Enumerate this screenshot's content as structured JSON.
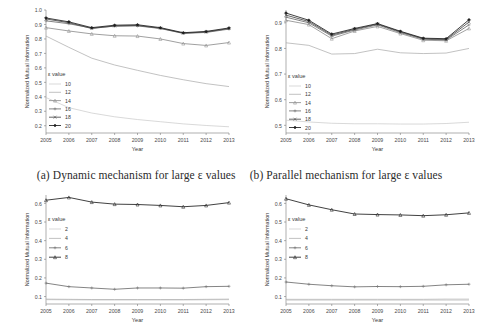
{
  "figure": {
    "captions": [
      {
        "id": "a",
        "text": "(a) Dynamic mechanism for large ε values"
      },
      {
        "id": "b",
        "text": "(b) Parallel mechanism for large ε values"
      }
    ]
  },
  "chart_data": [
    {
      "id": "panel-a",
      "type": "line",
      "title": "",
      "xlabel": "Year",
      "ylabel": "Normalized Mutual Information",
      "x": [
        2005,
        2006,
        2007,
        2008,
        2009,
        2010,
        2011,
        2012,
        2013
      ],
      "categories": [
        "2005",
        "2006",
        "2007",
        "2008",
        "2009",
        "2010",
        "2011",
        "2012",
        "2013"
      ],
      "xlim": [
        2005,
        2013
      ],
      "ylim": [
        0.15,
        1.0
      ],
      "yticks": [
        0.2,
        0.3,
        0.4,
        0.5,
        0.6,
        0.7,
        0.8,
        0.9,
        1.0
      ],
      "ytick_labels": [
        "0.2",
        "0.3",
        "0.4",
        "0.5",
        "0.6",
        "0.7",
        "0.8",
        "0.9",
        "1.0"
      ],
      "grid": false,
      "legend": {
        "title": "ε value",
        "position": "left-inside",
        "entries": [
          "10",
          "12",
          "14",
          "16",
          "18",
          "20"
        ]
      },
      "series": [
        {
          "name": "10",
          "color": "#c9c9c9",
          "marker": "none",
          "values": [
            0.395,
            0.325,
            0.288,
            0.262,
            0.243,
            0.228,
            0.213,
            0.202,
            0.193
          ]
        },
        {
          "name": "12",
          "color": "#a8a8a8",
          "marker": "none",
          "values": [
            0.82,
            0.742,
            0.667,
            0.62,
            0.583,
            0.548,
            0.518,
            0.491,
            0.471
          ]
        },
        {
          "name": "14",
          "color": "#8f8f8f",
          "marker": "triangle",
          "values": [
            0.878,
            0.855,
            0.835,
            0.822,
            0.82,
            0.8,
            0.768,
            0.755,
            0.775
          ]
        },
        {
          "name": "16",
          "color": "#6e6e6e",
          "marker": "plus",
          "values": [
            0.925,
            0.905,
            0.875,
            0.888,
            0.89,
            0.872,
            0.838,
            0.845,
            0.868
          ]
        },
        {
          "name": "18",
          "color": "#4a4a4a",
          "marker": "cross",
          "values": [
            0.938,
            0.912,
            0.872,
            0.89,
            0.893,
            0.874,
            0.84,
            0.848,
            0.872
          ]
        },
        {
          "name": "20",
          "color": "#1f1f1f",
          "marker": "diamond",
          "values": [
            0.945,
            0.918,
            0.878,
            0.895,
            0.898,
            0.878,
            0.843,
            0.852,
            0.876
          ]
        }
      ]
    },
    {
      "id": "panel-b",
      "type": "line",
      "title": "",
      "xlabel": "Year",
      "ylabel": "Normalized Mutual Information",
      "x": [
        2005,
        2006,
        2007,
        2008,
        2009,
        2010,
        2011,
        2012,
        2013
      ],
      "categories": [
        "2005",
        "2006",
        "2007",
        "2008",
        "2009",
        "2010",
        "2011",
        "2012",
        "2013"
      ],
      "xlim": [
        2005,
        2013
      ],
      "ylim": [
        0.47,
        0.95
      ],
      "yticks": [
        0.5,
        0.6,
        0.7,
        0.8,
        0.9
      ],
      "ytick_labels": [
        "0.5",
        "0.6",
        "0.7",
        "0.8",
        "0.9"
      ],
      "grid": false,
      "legend": {
        "title": "ε value",
        "position": "left-inside",
        "entries": [
          "10",
          "12",
          "14",
          "16",
          "18",
          "20"
        ]
      },
      "series": [
        {
          "name": "10",
          "color": "#c9c9c9",
          "marker": "none",
          "values": [
            0.52,
            0.513,
            0.508,
            0.506,
            0.506,
            0.505,
            0.505,
            0.507,
            0.512
          ]
        },
        {
          "name": "12",
          "color": "#a8a8a8",
          "marker": "none",
          "values": [
            0.822,
            0.812,
            0.778,
            0.78,
            0.797,
            0.783,
            0.78,
            0.782,
            0.8
          ]
        },
        {
          "name": "14",
          "color": "#8f8f8f",
          "marker": "triangle",
          "values": [
            0.91,
            0.893,
            0.838,
            0.868,
            0.886,
            0.858,
            0.832,
            0.83,
            0.878
          ]
        },
        {
          "name": "16",
          "color": "#6e6e6e",
          "marker": "plus",
          "values": [
            0.922,
            0.9,
            0.848,
            0.872,
            0.892,
            0.862,
            0.836,
            0.833,
            0.892
          ]
        },
        {
          "name": "18",
          "color": "#4a4a4a",
          "marker": "cross",
          "values": [
            0.93,
            0.905,
            0.852,
            0.875,
            0.895,
            0.865,
            0.838,
            0.835,
            0.903
          ]
        },
        {
          "name": "20",
          "color": "#1f1f1f",
          "marker": "diamond",
          "values": [
            0.938,
            0.91,
            0.856,
            0.878,
            0.897,
            0.867,
            0.84,
            0.838,
            0.912
          ]
        }
      ]
    },
    {
      "id": "panel-c",
      "type": "line",
      "title": "",
      "xlabel": "Year",
      "ylabel": "Normalized Mutual Information",
      "x": [
        2005,
        2006,
        2007,
        2008,
        2009,
        2010,
        2011,
        2012,
        2013
      ],
      "categories": [
        "2005",
        "2006",
        "2007",
        "2008",
        "2009",
        "2010",
        "2011",
        "2012",
        "2013"
      ],
      "xlim": [
        2005,
        2013
      ],
      "ylim": [
        0.06,
        0.645
      ],
      "yticks": [
        0.1,
        0.2,
        0.3,
        0.4,
        0.5,
        0.6
      ],
      "ytick_labels": [
        "0.1",
        "0.2",
        "0.3",
        "0.4",
        "0.5",
        "0.6"
      ],
      "grid": false,
      "legend": {
        "title": "ε value",
        "position": "left-inside",
        "entries": [
          "2",
          "4",
          "6",
          "8"
        ]
      },
      "series": [
        {
          "name": "2",
          "color": "#c9c9c9",
          "marker": "none",
          "values": [
            0.083,
            0.082,
            0.081,
            0.081,
            0.081,
            0.081,
            0.081,
            0.082,
            0.083
          ]
        },
        {
          "name": "4",
          "color": "#a8a8a8",
          "marker": "none",
          "values": [
            0.086,
            0.085,
            0.084,
            0.084,
            0.084,
            0.084,
            0.084,
            0.085,
            0.086
          ]
        },
        {
          "name": "6",
          "color": "#6e6e6e",
          "marker": "plus",
          "values": [
            0.172,
            0.153,
            0.146,
            0.139,
            0.146,
            0.146,
            0.145,
            0.153,
            0.155
          ]
        },
        {
          "name": "8",
          "color": "#1f1f1f",
          "marker": "triangle",
          "values": [
            0.617,
            0.632,
            0.607,
            0.596,
            0.594,
            0.589,
            0.582,
            0.589,
            0.604
          ]
        }
      ]
    },
    {
      "id": "panel-d",
      "type": "line",
      "title": "",
      "xlabel": "Year",
      "ylabel": "Normalized Mutual Information",
      "x": [
        2005,
        2006,
        2007,
        2008,
        2009,
        2010,
        2011,
        2012,
        2013
      ],
      "categories": [
        "2005",
        "2006",
        "2007",
        "2008",
        "2009",
        "2010",
        "2011",
        "2012",
        "2013"
      ],
      "xlim": [
        2005,
        2013
      ],
      "ylim": [
        0.06,
        0.645
      ],
      "yticks": [
        0.1,
        0.2,
        0.3,
        0.4,
        0.5,
        0.6
      ],
      "ytick_labels": [
        "0.1",
        "0.2",
        "0.3",
        "0.4",
        "0.5",
        "0.6"
      ],
      "grid": false,
      "legend": {
        "title": "ε value",
        "position": "left-inside",
        "entries": [
          "2",
          "4",
          "6",
          "8"
        ]
      },
      "series": [
        {
          "name": "2",
          "color": "#c9c9c9",
          "marker": "none",
          "values": [
            0.08,
            0.08,
            0.08,
            0.08,
            0.08,
            0.08,
            0.08,
            0.08,
            0.08
          ]
        },
        {
          "name": "4",
          "color": "#a8a8a8",
          "marker": "none",
          "values": [
            0.085,
            0.085,
            0.085,
            0.085,
            0.085,
            0.085,
            0.085,
            0.086,
            0.086
          ]
        },
        {
          "name": "6",
          "color": "#6e6e6e",
          "marker": "plus",
          "values": [
            0.178,
            0.166,
            0.158,
            0.152,
            0.154,
            0.153,
            0.155,
            0.163,
            0.166
          ]
        },
        {
          "name": "8",
          "color": "#1f1f1f",
          "marker": "triangle",
          "values": [
            0.625,
            0.592,
            0.566,
            0.543,
            0.54,
            0.538,
            0.534,
            0.539,
            0.549
          ]
        }
      ]
    }
  ]
}
